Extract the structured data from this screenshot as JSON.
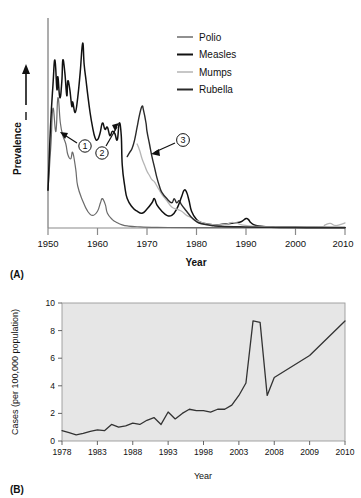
{
  "figure": {
    "panel_a_tag": "(A)",
    "panel_b_tag": "(B)"
  },
  "panel_a": {
    "ylabel": "Prevalence",
    "xlabel": "Year",
    "legend": [
      {
        "label": "Polio",
        "color": "#6b6b6b"
      },
      {
        "label": "Measles",
        "color": "#111111"
      },
      {
        "label": "Mumps",
        "color": "#b5b5b5"
      },
      {
        "label": "Rubella",
        "color": "#2a2a2a"
      }
    ],
    "xticks": [
      "1950",
      "1960",
      "1970",
      "1980",
      "1990",
      "2000",
      "2010"
    ],
    "callouts": [
      {
        "id": "1",
        "label": "1"
      },
      {
        "id": "2",
        "label": "2"
      },
      {
        "id": "3",
        "label": "3"
      }
    ]
  },
  "panel_b": {
    "ylabel": "Cases (per 100,000 population)",
    "xlabel": "Year",
    "yticks": [
      "0",
      "2",
      "4",
      "6",
      "8",
      "10"
    ],
    "xticks": [
      "1978",
      "1983",
      "1988",
      "1993",
      "1998",
      "2003",
      "2008",
      "2009",
      "2010"
    ],
    "plot_bg": "#e6e6e6"
  },
  "chart_data": [
    {
      "type": "line",
      "panel": "A",
      "title": "",
      "xlabel": "Year",
      "ylabel": "Prevalence",
      "xlim": [
        1950,
        2010
      ],
      "ylim": [
        0,
        100
      ],
      "yaxis_ticks": false,
      "yaxis_arrow": true,
      "grid": false,
      "legend_position": "upper-right",
      "annotations": [
        {
          "text": "1",
          "points_to_year": 1955,
          "note": "polio vaccine introduced"
        },
        {
          "text": "2",
          "points_to_year": 1964,
          "note": "measles vaccine introduced"
        },
        {
          "text": "3",
          "points_to_year": 1971,
          "note": "mumps/rubella vaccine introduced"
        }
      ],
      "series": [
        {
          "name": "Polio",
          "color": "#6b6b6b",
          "points": [
            [
              1950,
              18
            ],
            [
              1950.6,
              40
            ],
            [
              1951,
              57
            ],
            [
              1951.6,
              46
            ],
            [
              1952,
              62
            ],
            [
              1952.5,
              50
            ],
            [
              1953,
              44
            ],
            [
              1953.6,
              40
            ],
            [
              1954,
              35
            ],
            [
              1954.6,
              33
            ],
            [
              1955,
              36
            ],
            [
              1955.6,
              28
            ],
            [
              1956,
              20
            ],
            [
              1957,
              13
            ],
            [
              1958,
              8
            ],
            [
              1959,
              6
            ],
            [
              1960,
              8
            ],
            [
              1960.6,
              12
            ],
            [
              1961,
              14
            ],
            [
              1961.6,
              11
            ],
            [
              1962,
              7
            ],
            [
              1963,
              4
            ],
            [
              1964,
              2.5
            ],
            [
              1965,
              1.5
            ],
            [
              1966,
              1
            ],
            [
              1968,
              0.6
            ],
            [
              1972,
              0.3
            ],
            [
              1980,
              0.2
            ],
            [
              1990,
              0.15
            ],
            [
              2000,
              0.1
            ],
            [
              2010,
              0.1
            ]
          ]
        },
        {
          "name": "Measles",
          "color": "#111111",
          "points": [
            [
              1950,
              18
            ],
            [
              1950.5,
              48
            ],
            [
              1951,
              68
            ],
            [
              1951.4,
              80
            ],
            [
              1951.8,
              66
            ],
            [
              1952,
              72
            ],
            [
              1952.4,
              62
            ],
            [
              1952.8,
              70
            ],
            [
              1953,
              80
            ],
            [
              1953.4,
              74
            ],
            [
              1953.8,
              63
            ],
            [
              1954,
              70
            ],
            [
              1954.4,
              66
            ],
            [
              1954.8,
              58
            ],
            [
              1955,
              60
            ],
            [
              1955.5,
              55
            ],
            [
              1956,
              62
            ],
            [
              1956.5,
              74
            ],
            [
              1957,
              88
            ],
            [
              1957.3,
              78
            ],
            [
              1957.7,
              70
            ],
            [
              1958,
              64
            ],
            [
              1958.5,
              55
            ],
            [
              1959,
              48
            ],
            [
              1959.5,
              43
            ],
            [
              1960,
              42
            ],
            [
              1960.5,
              45
            ],
            [
              1961,
              50
            ],
            [
              1961.5,
              47
            ],
            [
              1962,
              48
            ],
            [
              1962.5,
              44
            ],
            [
              1963,
              46
            ],
            [
              1963.5,
              45
            ],
            [
              1964,
              42
            ],
            [
              1964.4,
              50
            ],
            [
              1964.8,
              44
            ],
            [
              1965,
              30
            ],
            [
              1965.5,
              20
            ],
            [
              1966,
              14
            ],
            [
              1967,
              10
            ],
            [
              1968,
              8
            ],
            [
              1969,
              7
            ],
            [
              1970,
              9
            ],
            [
              1971,
              12
            ],
            [
              1971.5,
              14
            ],
            [
              1972,
              11
            ],
            [
              1973,
              8
            ],
            [
              1974,
              6
            ],
            [
              1975,
              6
            ],
            [
              1976,
              9
            ],
            [
              1977,
              15
            ],
            [
              1977.5,
              18
            ],
            [
              1978,
              17
            ],
            [
              1978.5,
              13
            ],
            [
              1979,
              8
            ],
            [
              1980,
              4
            ],
            [
              1981,
              2.5
            ],
            [
              1982,
              2
            ],
            [
              1984,
              1.5
            ],
            [
              1986,
              2
            ],
            [
              1988,
              2.5
            ],
            [
              1989,
              3
            ],
            [
              1990,
              4.5
            ],
            [
              1990.5,
              4
            ],
            [
              1991,
              2.5
            ],
            [
              1992,
              1.2
            ],
            [
              1994,
              0.6
            ],
            [
              1996,
              0.4
            ],
            [
              2000,
              0.3
            ],
            [
              2005,
              0.25
            ],
            [
              2010,
              0.25
            ]
          ]
        },
        {
          "name": "Mumps",
          "color": "#b5b5b5",
          "points": [
            [
              1968,
              40
            ],
            [
              1968.5,
              37
            ],
            [
              1969,
              33
            ],
            [
              1969.5,
              30
            ],
            [
              1970,
              27
            ],
            [
              1970.5,
              25
            ],
            [
              1971,
              23
            ],
            [
              1971.5,
              22
            ],
            [
              1972,
              20
            ],
            [
              1972.5,
              18
            ],
            [
              1973,
              16
            ],
            [
              1974,
              13
            ],
            [
              1975,
              10
            ],
            [
              1976,
              9
            ],
            [
              1977,
              8
            ],
            [
              1978,
              6
            ],
            [
              1979,
              5
            ],
            [
              1980,
              3.5
            ],
            [
              1982,
              2
            ],
            [
              1984,
              1.5
            ],
            [
              1986,
              1.8
            ],
            [
              1987,
              2.6
            ],
            [
              1988,
              2.4
            ],
            [
              1989,
              1.6
            ],
            [
              1990,
              1.2
            ],
            [
              1992,
              0.8
            ],
            [
              1995,
              0.5
            ],
            [
              2000,
              0.4
            ],
            [
              2005,
              0.5
            ],
            [
              2006,
              1.5
            ],
            [
              2007,
              2.2
            ],
            [
              2008,
              1.2
            ],
            [
              2009,
              1.6
            ],
            [
              2010,
              2.4
            ]
          ]
        },
        {
          "name": "Rubella",
          "color": "#2a2a2a",
          "points": [
            [
              1966,
              34
            ],
            [
              1966.5,
              36
            ],
            [
              1967,
              38
            ],
            [
              1967.5,
              42
            ],
            [
              1968,
              48
            ],
            [
              1968.5,
              54
            ],
            [
              1969,
              58
            ],
            [
              1969.3,
              56
            ],
            [
              1969.8,
              50
            ],
            [
              1970,
              46
            ],
            [
              1970.5,
              40
            ],
            [
              1971,
              34
            ],
            [
              1971.5,
              29
            ],
            [
              1972,
              24
            ],
            [
              1972.5,
              20
            ],
            [
              1973,
              17
            ],
            [
              1974,
              14
            ],
            [
              1975,
              12
            ],
            [
              1975.5,
              14
            ],
            [
              1976,
              12
            ],
            [
              1976.5,
              13
            ],
            [
              1977,
              11
            ],
            [
              1978,
              8
            ],
            [
              1979,
              5
            ],
            [
              1980,
              3
            ],
            [
              1981,
              2
            ],
            [
              1983,
              1.2
            ],
            [
              1985,
              0.8
            ],
            [
              1990,
              0.5
            ],
            [
              1995,
              0.3
            ],
            [
              2000,
              0.25
            ],
            [
              2010,
              0.2
            ]
          ]
        }
      ]
    },
    {
      "type": "line",
      "panel": "B",
      "title": "",
      "xlabel": "Year",
      "ylabel": "Cases (per 100,000 population)",
      "xlim": [
        1978,
        2010
      ],
      "ylim": [
        0,
        10
      ],
      "yticks": [
        0,
        2,
        4,
        6,
        8,
        10
      ],
      "grid": false,
      "plot_background": "#e6e6e6",
      "line_color": "#333333",
      "x": [
        1978,
        1979,
        1980,
        1981,
        1982,
        1983,
        1984,
        1985,
        1986,
        1987,
        1988,
        1989,
        1990,
        1991,
        1992,
        1993,
        1994,
        1995,
        1996,
        1997,
        1998,
        1999,
        2000,
        2001,
        2002,
        2003,
        2004,
        2005,
        2006,
        2007,
        2008,
        2009,
        2010
      ],
      "y": [
        0.75,
        0.6,
        0.45,
        0.55,
        0.7,
        0.8,
        0.75,
        1.2,
        1.0,
        1.1,
        1.3,
        1.2,
        1.5,
        1.7,
        1.2,
        2.1,
        1.6,
        2.0,
        2.3,
        2.2,
        2.2,
        2.1,
        2.3,
        2.3,
        2.6,
        3.3,
        4.2,
        8.7,
        8.6,
        3.3,
        4.6,
        6.2,
        8.7
      ]
    }
  ]
}
